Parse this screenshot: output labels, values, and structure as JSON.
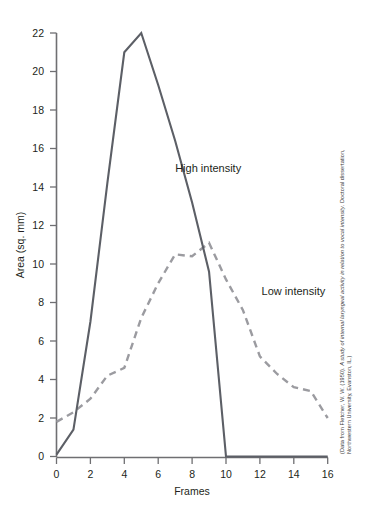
{
  "chart_data": {
    "type": "line",
    "title": "",
    "xlabel": "Frames",
    "ylabel": "Area (sq. mm)",
    "xlim": [
      0,
      16
    ],
    "ylim": [
      0,
      22
    ],
    "xticks": [
      0,
      2,
      4,
      6,
      8,
      10,
      12,
      14,
      16
    ],
    "yticks": [
      0,
      2,
      4,
      6,
      8,
      10,
      12,
      14,
      16,
      18,
      20,
      22
    ],
    "xtick_labels": [
      "0",
      "2",
      "4",
      "6",
      "8",
      "10",
      "12",
      "14",
      "16"
    ],
    "ytick_labels": [
      "0",
      "2",
      "4",
      "6",
      "8",
      "10",
      "12",
      "14",
      "16",
      "18",
      "20",
      "22"
    ],
    "grid": false,
    "legend": "inline-annotations",
    "x": [
      0,
      1,
      2,
      3,
      4,
      5,
      6,
      7,
      8,
      9,
      10,
      11,
      12,
      13,
      14,
      15,
      16
    ],
    "series": [
      {
        "name": "High intensity",
        "style": "solid",
        "color": "#5c5f66",
        "values": [
          0.1,
          1.4,
          7.0,
          14.2,
          21.0,
          22.0,
          19.3,
          16.4,
          13.2,
          9.6,
          0.0,
          0.0,
          0.0,
          0.0,
          0.0,
          0.0,
          0.0
        ]
      },
      {
        "name": "Low intensity",
        "style": "dashed",
        "color": "#9b9ba0",
        "values": [
          1.8,
          2.3,
          3.0,
          4.2,
          4.6,
          7.2,
          9.0,
          10.5,
          10.4,
          11.1,
          9.2,
          7.6,
          5.2,
          4.3,
          3.6,
          3.4,
          2.0
        ]
      }
    ],
    "annotations": [
      {
        "text": "High intensity",
        "x": 7.0,
        "y": 14.8
      },
      {
        "text": "Low intensity",
        "x": 12.1,
        "y": 8.4
      }
    ]
  },
  "source_note": {
    "line1_prefix": "(Data from Fletcher, W. W. (1950). ",
    "line1_italic": "A study of internal laryngeal activity in relation to vocal intensity",
    "line1_suffix": ". Doctoral dissertation,",
    "line2": "Northwestern University, Evanston, IL.)"
  }
}
